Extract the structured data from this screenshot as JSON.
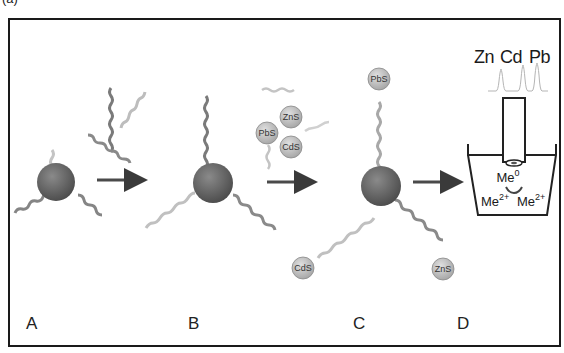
{
  "figure": {
    "panel_label": "(a)",
    "stages": [
      {
        "id": "A",
        "label": "A"
      },
      {
        "id": "B",
        "label": "B"
      },
      {
        "id": "C",
        "label": "C"
      },
      {
        "id": "D",
        "label": "D"
      }
    ],
    "nanoparticles": {
      "pbs": "PbS",
      "zns": "ZnS",
      "cds": "CdS"
    },
    "stripping_peaks": {
      "labels": [
        "Zn",
        "Cd",
        "Pb"
      ]
    },
    "electrode": {
      "reduced": "Me",
      "reduced_sup": "0",
      "ion1": "Me",
      "ion1_sup": "2+",
      "ion2": "Me",
      "ion2_sup": "2+"
    },
    "colors": {
      "frame": "#1a1a1a",
      "bead": "#6e6e6e",
      "strand_dark": "#7a7a7a",
      "strand_light": "#bdbdbd",
      "nanoparticle": "#c8c8c8",
      "arrow": "#4a4a4a"
    }
  }
}
